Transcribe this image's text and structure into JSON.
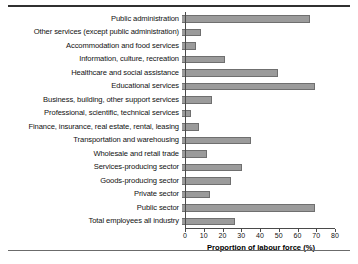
{
  "chart_data": {
    "type": "bar",
    "orientation": "horizontal",
    "title": "",
    "xlabel": "Proportion of labour force (%)",
    "ylabel": "",
    "xlim": [
      0,
      80
    ],
    "xticks": [
      0,
      10,
      20,
      30,
      40,
      50,
      60,
      70,
      80
    ],
    "grid": false,
    "legend": null,
    "bar_color": "#9b9b9b",
    "bar_edge_color": "#6f6f6f",
    "categories": [
      "Public administration",
      "Other services (except public administration)",
      "Accommodation and food services",
      "Information, culture, recreation",
      "Healthcare and social assistance",
      "Educational services",
      "Business, building, other support services",
      "Professional, scientific, technical services",
      "Finance, insurance, real estate, rental, leasing",
      "Transportation and warehousing",
      "Wholesale and retail trade",
      "Services-producing sector",
      "Goods-producing sector",
      "Private sector",
      "Public sector",
      "Total employees all industry"
    ],
    "values": [
      68.5,
      10,
      7.5,
      23,
      51,
      71,
      16,
      5,
      9,
      37,
      13.5,
      32,
      26,
      15,
      71,
      28
    ]
  },
  "axis": {
    "tick_labels": [
      "0",
      "10",
      "20",
      "30",
      "40",
      "50",
      "60",
      "70",
      "80"
    ],
    "title": "Proportion of labour force (%)"
  }
}
